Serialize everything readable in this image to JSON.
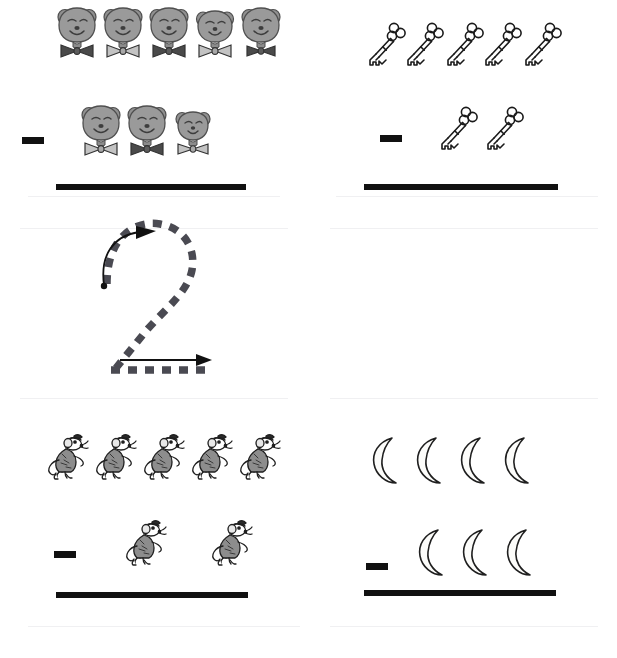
{
  "worksheet": {
    "title": "Subtraction picture worksheet with number 2 tracing guide",
    "background_color": "#ffffff",
    "ink_color": "#111111",
    "trace_color": "#4a4a52"
  },
  "trace": {
    "numeral": "2",
    "step_label": "1",
    "stroke_style": "dashed",
    "start_dot": "start-dot",
    "arrows": [
      {
        "name": "curved-start-arrow",
        "direction": "clockwise-up-right"
      },
      {
        "name": "bottom-arrow",
        "direction": "right"
      }
    ]
  },
  "problems": [
    {
      "id": "problem-top-left",
      "item": "bear",
      "item_label": "bear-face-with-bowtie",
      "minuend": 5,
      "subtrahend": 3,
      "operator": "minus",
      "answer": "",
      "top_bowties": [
        "dark",
        "light",
        "dark",
        "light",
        "dark"
      ],
      "bottom_bowties": [
        "light",
        "dark",
        "light"
      ]
    },
    {
      "id": "problem-top-right",
      "item": "key",
      "item_label": "skeleton-key",
      "minuend": 5,
      "subtrahend": 2,
      "operator": "minus",
      "answer": ""
    },
    {
      "id": "problem-bottom-left",
      "item": "mouse",
      "item_label": "standing-mouse",
      "minuend": 5,
      "subtrahend": 2,
      "operator": "minus",
      "answer": ""
    },
    {
      "id": "problem-bottom-right",
      "item": "moon",
      "item_label": "crescent-moon",
      "minuend": 4,
      "subtrahend": 3,
      "operator": "minus",
      "answer": ""
    }
  ]
}
